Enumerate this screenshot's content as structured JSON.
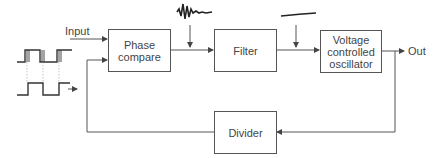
{
  "diagram": {
    "type": "block-diagram",
    "labels": {
      "input": "Input",
      "output": "Out"
    },
    "blocks": [
      {
        "id": "phase",
        "label": "Phase\ncompare"
      },
      {
        "id": "filter",
        "label": "Filter"
      },
      {
        "id": "vco",
        "label": "Voltage\ncontrolled\noscillator"
      },
      {
        "id": "divider",
        "label": "Divider"
      }
    ],
    "connections": [
      [
        "input",
        "phase"
      ],
      [
        "phase",
        "filter"
      ],
      [
        "filter",
        "vco"
      ],
      [
        "vco",
        "out"
      ],
      [
        "vco",
        "divider"
      ],
      [
        "divider",
        "phase"
      ]
    ],
    "annotations": [
      {
        "near": "phase-filter",
        "icon": "noisy-waveform-icon"
      },
      {
        "near": "filter-vco",
        "icon": "smooth-dc-level-icon"
      },
      {
        "near": "input",
        "icon": "square-waves-icon"
      }
    ],
    "colors": {
      "line": "#555555",
      "text": "#444444",
      "background": "#ffffff"
    }
  }
}
